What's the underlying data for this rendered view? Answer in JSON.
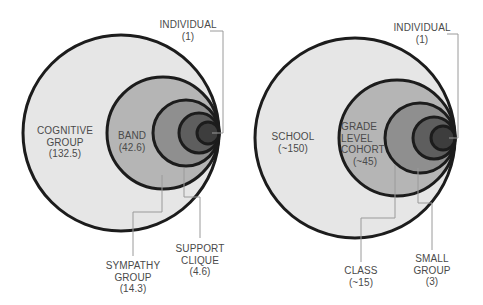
{
  "colors": {
    "ring_fills": [
      "#e6e6e6",
      "#b5b5b5",
      "#8f8f8f",
      "#5e5e5e",
      "#3d3d3d"
    ],
    "ring_stroke": "#1c1c1c",
    "leader_line": "#9a9a9a",
    "label_text": "#4a4a4a"
  },
  "left_diagram": {
    "levels": [
      {
        "name": "COGNITIVE GROUP",
        "line1": "COGNITIVE",
        "line2": "GROUP",
        "value": "(132.5)"
      },
      {
        "name": "BAND",
        "line1": "BAND",
        "value": "(42.6)"
      },
      {
        "name": "SYMPATHY GROUP",
        "line1": "SYMPATHY",
        "line2": "GROUP",
        "value": "(14.3)"
      },
      {
        "name": "SUPPORT CLIQUE",
        "line1": "SUPPORT",
        "line2": "CLIQUE",
        "value": "(4.6)"
      },
      {
        "name": "INDIVIDUAL",
        "line1": "INDIVIDUAL",
        "value": "(1)"
      }
    ]
  },
  "right_diagram": {
    "levels": [
      {
        "name": "SCHOOL",
        "line1": "SCHOOL",
        "value": "(~150)"
      },
      {
        "name": "GRADE LEVEL COHORT",
        "line1": "GRADE",
        "line2": "LEVEL",
        "line3": "COHORT",
        "value": "(~45)"
      },
      {
        "name": "CLASS",
        "line1": "CLASS",
        "value": "(~15)"
      },
      {
        "name": "SMALL GROUP",
        "line1": "SMALL",
        "line2": "GROUP",
        "value": "(3)"
      },
      {
        "name": "INDIVIDUAL",
        "line1": "INDIVIDUAL",
        "value": "(1)"
      }
    ]
  }
}
